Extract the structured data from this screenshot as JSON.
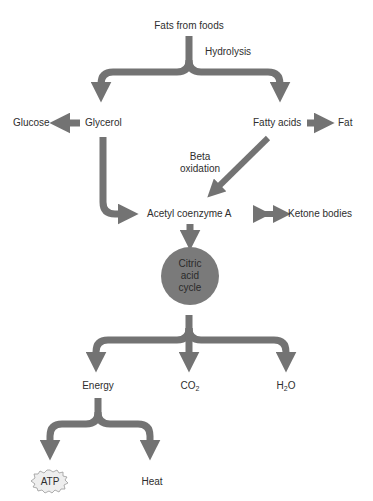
{
  "colors": {
    "arrow": "#737373",
    "circle": "#7a7a7a",
    "text": "#2e2e2e",
    "atp_burst": "#eeeeee"
  },
  "nodes": {
    "fats_from_foods": "Fats from foods",
    "hydrolysis": "Hydrolysis",
    "glucose": "Glucose",
    "glycerol": "Glycerol",
    "fatty_acids": "Fatty acids",
    "fat": "Fat",
    "beta": "Beta",
    "oxidation": "oxidation",
    "acetyl_coa": "Acetyl coenzyme A",
    "ketone_bodies": "Ketone bodies",
    "citric_line1": "Citric",
    "citric_line2": "acid",
    "citric_line3": "cycle",
    "energy": "Energy",
    "co2_base": "CO",
    "co2_sub": "2",
    "h2o_h": "H",
    "h2o_sub": "2",
    "h2o_o": "O",
    "atp": "ATP",
    "heat": "Heat"
  },
  "edges": [
    {
      "from": "Fats from foods",
      "to": "Glycerol",
      "label": "Hydrolysis"
    },
    {
      "from": "Fats from foods",
      "to": "Fatty acids",
      "label": "Hydrolysis"
    },
    {
      "from": "Glycerol",
      "to": "Glucose"
    },
    {
      "from": "Fatty acids",
      "to": "Fat"
    },
    {
      "from": "Glycerol",
      "to": "Acetyl coenzyme A"
    },
    {
      "from": "Fatty acids",
      "to": "Acetyl coenzyme A",
      "label": "Beta oxidation"
    },
    {
      "from": "Acetyl coenzyme A",
      "to": "Ketone bodies",
      "bidirectional": true
    },
    {
      "from": "Acetyl coenzyme A",
      "to": "Citric acid cycle"
    },
    {
      "from": "Citric acid cycle",
      "to": "Energy"
    },
    {
      "from": "Citric acid cycle",
      "to": "CO2"
    },
    {
      "from": "Citric acid cycle",
      "to": "H2O"
    },
    {
      "from": "Energy",
      "to": "ATP"
    },
    {
      "from": "Energy",
      "to": "Heat"
    }
  ]
}
